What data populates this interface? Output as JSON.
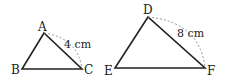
{
  "figures": [
    {
      "name": "triangle-abc",
      "vertices": [
        {
          "label": "A",
          "x": 44,
          "y": 33
        },
        {
          "label": "B",
          "x": 22,
          "y": 69
        },
        {
          "label": "C",
          "x": 82,
          "y": 69
        }
      ],
      "measure": {
        "text": "4 cm",
        "side": "AC"
      }
    },
    {
      "name": "triangle-def",
      "vertices": [
        {
          "label": "D",
          "x": 148,
          "y": 17
        },
        {
          "label": "E",
          "x": 115,
          "y": 68
        },
        {
          "label": "F",
          "x": 205,
          "y": 68
        }
      ],
      "measure": {
        "text": "8 cm",
        "side": "DF"
      }
    }
  ],
  "colors": {
    "stroke": "#222222",
    "arc": "#888888"
  }
}
